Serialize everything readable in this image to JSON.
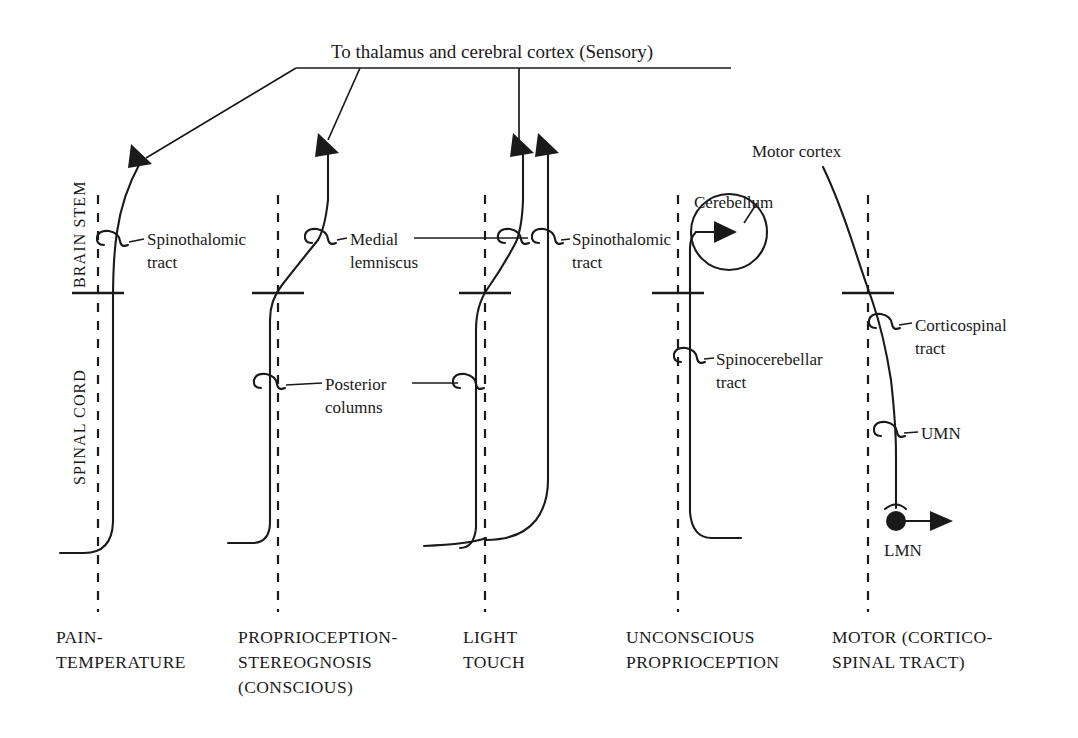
{
  "figure": {
    "title": "To thalamus and cerebral cortex (Sensory)",
    "region_upper": "BRAIN STEM",
    "region_lower": "SPINAL CORD"
  },
  "columns": [
    {
      "id": "pain-temperature",
      "caption_line1": "PAIN-",
      "caption_line2": "TEMPERATURE",
      "caption_line3": "",
      "labels": [
        {
          "name": "spinothalamic-tract",
          "line1": "Spinothalomic",
          "line2": "tract"
        }
      ]
    },
    {
      "id": "proprioception-stereognosis",
      "caption_line1": "PROPRIOCEPTION-",
      "caption_line2": "STEREOGNOSIS",
      "caption_line3": "(CONSCIOUS)",
      "labels": [
        {
          "name": "medial-lemniscus",
          "line1": "Medial",
          "line2": "lemniscus"
        },
        {
          "name": "posterior-columns",
          "line1": "Posterior",
          "line2": "columns"
        }
      ]
    },
    {
      "id": "light-touch",
      "caption_line1": "LIGHT",
      "caption_line2": "TOUCH",
      "caption_line3": "",
      "labels": [
        {
          "name": "spinothalamic-tract",
          "line1": "Spinothalomic",
          "line2": "tract"
        }
      ]
    },
    {
      "id": "unconscious-proprioception",
      "caption_line1": "UNCONSCIOUS",
      "caption_line2": "PROPRIOCEPTION",
      "caption_line3": "",
      "labels": [
        {
          "name": "cerebellum",
          "line1": "Cerebellum",
          "line2": ""
        },
        {
          "name": "spinocerebellar-tract",
          "line1": "Spinocerebellar",
          "line2": "tract"
        }
      ]
    },
    {
      "id": "motor-corticospinal-tract",
      "caption_line1": "MOTOR (CORTICO-",
      "caption_line2": "SPINAL TRACT)",
      "caption_line3": "",
      "labels": [
        {
          "name": "motor-cortex",
          "line1": "Motor cortex",
          "line2": ""
        },
        {
          "name": "corticospinal-tract",
          "line1": "Corticospinal",
          "line2": "tract"
        },
        {
          "name": "upper-motor-neuron",
          "line1": "UMN",
          "line2": ""
        },
        {
          "name": "lower-motor-neuron",
          "line1": "LMN",
          "line2": ""
        }
      ]
    }
  ],
  "colors": {
    "ink": "#1a1a1a",
    "background": "#ffffff"
  }
}
